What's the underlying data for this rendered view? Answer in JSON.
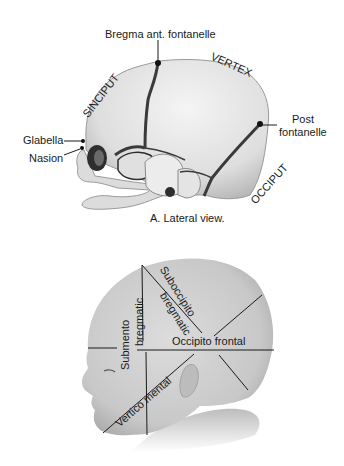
{
  "figure_a": {
    "caption": "A. Lateral view.",
    "labels": {
      "bregma": "Bregma ant. fontanelle",
      "vertex": "VERTEX",
      "sinciput": "SINCIPUT",
      "post_fontanelle_line1": "Post",
      "post_fontanelle_line2": "fontanelle",
      "glabella": "Glabella",
      "nasion": "Nasion",
      "occiput": "OCCIPUT"
    }
  },
  "figure_b": {
    "labels": {
      "suboccipito_line1": "Suboccipito",
      "suboccipito_line2": "bregmatic",
      "submento_line1": "Submento",
      "submento_line2": "bregmatic",
      "occipito_frontal": "Occipito frontal",
      "vertico_mental": "Vertico mental"
    }
  },
  "colors": {
    "bone": "#e6e6e6",
    "bone_shade": "#bdbdbd",
    "suture": "#3a3a3a",
    "skin": "#cfcfcf",
    "line": "#1a1a1a"
  }
}
